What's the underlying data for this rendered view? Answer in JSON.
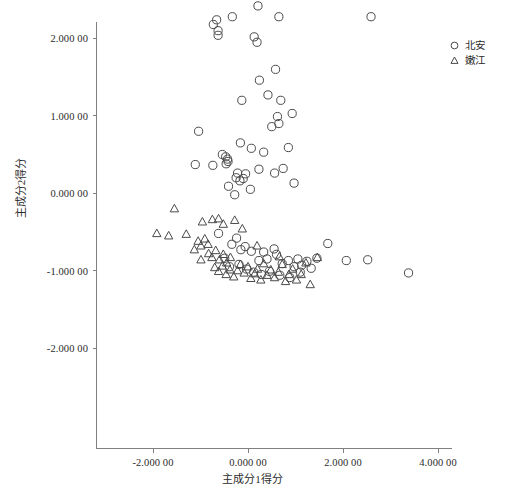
{
  "chart_data": {
    "type": "scatter",
    "title": "",
    "xlabel": "主成分1得分",
    "ylabel": "主成分2得分",
    "xlim": [
      -3.0,
      4.4
    ],
    "ylim": [
      -2.35,
      3.25
    ],
    "xticks": [
      -2.0,
      0.0,
      2.0,
      4.0
    ],
    "xticklabels": [
      "-2.000 00",
      "0.000 00",
      "2.000 00",
      "4.000 00"
    ],
    "yticks": [
      -2.0,
      -1.0,
      0.0,
      1.0,
      2.0,
      3.0
    ],
    "yticklabels": [
      "-2.000 00",
      "-1.000 00",
      "0.000 00",
      "1.000 00",
      "2.000 00",
      "3.000 00"
    ],
    "grid": false,
    "legend_position": "top-right",
    "marker_color": "#4a4a4a",
    "axis_color": "#808080",
    "series": [
      {
        "name": "北安",
        "marker": "circle",
        "points": [
          [
            -0.73,
            2.18
          ],
          [
            -0.66,
            2.24
          ],
          [
            -0.63,
            2.1
          ],
          [
            -0.63,
            2.04
          ],
          [
            -0.33,
            2.28
          ],
          [
            0.21,
            2.42
          ],
          [
            0.13,
            2.02
          ],
          [
            0.19,
            1.95
          ],
          [
            0.65,
            2.28
          ],
          [
            2.59,
            2.28
          ],
          [
            0.58,
            1.6
          ],
          [
            0.69,
            1.2
          ],
          [
            0.24,
            1.46
          ],
          [
            0.42,
            1.27
          ],
          [
            0.62,
            0.99
          ],
          [
            0.65,
            0.9
          ],
          [
            0.5,
            0.86
          ],
          [
            0.93,
            1.03
          ],
          [
            -0.13,
            1.2
          ],
          [
            -1.04,
            0.8
          ],
          [
            0.07,
            0.58
          ],
          [
            0.33,
            0.53
          ],
          [
            -0.16,
            0.65
          ],
          [
            0.85,
            0.59
          ],
          [
            -0.54,
            0.5
          ],
          [
            -1.11,
            0.37
          ],
          [
            -0.47,
            0.47
          ],
          [
            -0.43,
            0.44
          ],
          [
            -0.42,
            0.41
          ],
          [
            -0.46,
            0.38
          ],
          [
            -0.74,
            0.36
          ],
          [
            -0.22,
            0.26
          ],
          [
            -0.25,
            0.2
          ],
          [
            -0.1,
            0.19
          ],
          [
            -0.17,
            0.16
          ],
          [
            -0.05,
            0.25
          ],
          [
            0.23,
            0.31
          ],
          [
            0.56,
            0.26
          ],
          [
            -0.41,
            0.09
          ],
          [
            0.05,
            0.05
          ],
          [
            -0.28,
            -0.02
          ],
          [
            0.74,
            0.32
          ],
          [
            0.97,
            0.13
          ],
          [
            -0.62,
            -0.52
          ],
          [
            -0.34,
            -0.66
          ],
          [
            -0.24,
            -0.58
          ],
          [
            -0.15,
            -0.73
          ],
          [
            -0.06,
            -0.69
          ],
          [
            0.07,
            -0.75
          ],
          [
            0.23,
            -0.87
          ],
          [
            0.33,
            -0.76
          ],
          [
            0.4,
            -0.85
          ],
          [
            0.55,
            -0.72
          ],
          [
            0.6,
            -0.79
          ],
          [
            0.72,
            -0.91
          ],
          [
            0.85,
            -0.87
          ],
          [
            0.97,
            -0.95
          ],
          [
            1.05,
            -0.85
          ],
          [
            1.13,
            -0.93
          ],
          [
            1.24,
            -0.88
          ],
          [
            1.33,
            -0.97
          ],
          [
            1.45,
            -0.84
          ],
          [
            1.68,
            -0.65
          ],
          [
            2.07,
            -0.87
          ],
          [
            2.52,
            -0.86
          ],
          [
            3.38,
            -1.03
          ],
          [
            -0.49,
            -0.84
          ],
          [
            -0.39,
            -0.95
          ],
          [
            -0.19,
            -0.92
          ],
          [
            -0.03,
            -0.98
          ],
          [
            0.12,
            -1.02
          ],
          [
            0.28,
            -1.05
          ],
          [
            0.45,
            -1.01
          ],
          [
            0.67,
            -1.06
          ],
          [
            0.88,
            -1.09
          ],
          [
            1.1,
            -1.02
          ]
        ]
      },
      {
        "name": "嫩江",
        "marker": "triangle",
        "points": [
          [
            -1.55,
            -0.2
          ],
          [
            -1.92,
            -0.52
          ],
          [
            -1.67,
            -0.55
          ],
          [
            -1.3,
            -0.53
          ],
          [
            -0.96,
            -0.37
          ],
          [
            -0.75,
            -0.34
          ],
          [
            -0.62,
            -0.33
          ],
          [
            -1.05,
            -0.62
          ],
          [
            -0.99,
            -0.68
          ],
          [
            -0.91,
            -0.59
          ],
          [
            -0.84,
            -0.66
          ],
          [
            -0.52,
            -0.4
          ],
          [
            -0.28,
            -0.35
          ],
          [
            -0.12,
            -0.46
          ],
          [
            -0.83,
            -0.78
          ],
          [
            -0.76,
            -0.83
          ],
          [
            -0.68,
            -0.74
          ],
          [
            -0.6,
            -0.86
          ],
          [
            -0.52,
            -0.79
          ],
          [
            -0.45,
            -0.9
          ],
          [
            -0.37,
            -0.83
          ],
          [
            -0.7,
            -0.96
          ],
          [
            -0.62,
            -1.01
          ],
          [
            -0.54,
            -0.94
          ],
          [
            -0.46,
            -1.05
          ],
          [
            -0.38,
            -0.99
          ],
          [
            -0.3,
            -1.08
          ],
          [
            -0.22,
            -1.0
          ],
          [
            -0.16,
            -0.92
          ],
          [
            -0.08,
            -1.03
          ],
          [
            0.0,
            -0.95
          ],
          [
            0.06,
            -1.1
          ],
          [
            0.14,
            -1.04
          ],
          [
            0.2,
            -0.98
          ],
          [
            0.27,
            -1.12
          ],
          [
            0.33,
            -0.91
          ],
          [
            0.4,
            -1.06
          ],
          [
            0.48,
            -0.99
          ],
          [
            0.56,
            -1.09
          ],
          [
            0.64,
            -1.02
          ],
          [
            0.72,
            -0.92
          ],
          [
            0.79,
            -1.14
          ],
          [
            0.86,
            -1.05
          ],
          [
            0.94,
            -0.98
          ],
          [
            1.02,
            -1.12
          ],
          [
            1.12,
            -1.05
          ],
          [
            1.22,
            -0.9
          ],
          [
            1.31,
            -1.18
          ],
          [
            -1.13,
            -0.73
          ],
          [
            -0.99,
            -0.86
          ],
          [
            0.19,
            -0.68
          ],
          [
            0.66,
            -0.82
          ],
          [
            1.46,
            -0.83
          ]
        ]
      }
    ]
  },
  "legend": {
    "items": [
      {
        "label": "北安",
        "marker": "circle"
      },
      {
        "label": "嫩江",
        "marker": "triangle"
      }
    ]
  }
}
